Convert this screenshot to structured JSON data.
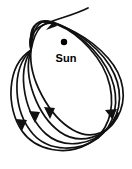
{
  "figure": {
    "kind": "orbit-precession-diagram",
    "width": 132,
    "height": 169,
    "background_color": "#ffffff",
    "stroke_color": "#111111",
    "line_width": 1.7
  },
  "sun": {
    "label": "Sun",
    "dot_color": "#000000",
    "dot_radius": 3.2,
    "center_x": 64,
    "center_y": 42,
    "label_x": 64,
    "label_y": 53
  },
  "node": {
    "name": "convergence-node",
    "description": "Common point where all orbital loops cross",
    "x": 31,
    "y": 50
  },
  "orbits": [
    {
      "id": "orbit-1",
      "label": "orbit loop 1",
      "rotation_deg": 0,
      "path": "M31,50 C6,66 6,108 22,131 C36,151 66,156 88,144 C108,133 115,110 110,86 C104,58 78,33 58,25 C44,19 35,28 31,50 Z"
    },
    {
      "id": "orbit-2",
      "label": "orbit loop 2",
      "rotation_deg": 9,
      "path": "M31,50 C10,70 14,112 33,134 C49,152 79,152 98,138 C116,124 120,100 111,77 C100,50 72,28 52,22 C39,18 32,29 31,50 Z"
    },
    {
      "id": "orbit-3",
      "label": "orbit loop 3",
      "rotation_deg": 18,
      "path": "M31,50 C16,74 25,115 46,134 C64,150 93,145 108,128 C123,111 123,87 110,66 C95,42 65,24 47,21 C35,19 30,31 31,50 Z"
    },
    {
      "id": "orbit-4",
      "label": "orbit loop 4",
      "rotation_deg": 27,
      "path": "M31,50 C22,77 38,116 60,132 C80,146 106,137 117,118 C128,99 124,76 108,58 C90,37 60,22 43,22 C32,22 29,33 31,50 Z"
    },
    {
      "id": "orbit-5",
      "label": "orbit loop 5 (outermost, with entry tail)",
      "rotation_deg": 36,
      "path": "M88,8 C72,16 55,19 43,25 C31,31 28,40 31,50 C31,50 31,50 31,50 C28,79 50,117 73,130 C92,141 112,132 118,113"
    }
  ],
  "arrows": [
    {
      "id": "arrow-top",
      "label": "inbound direction arrow (top)",
      "tip_x": 46,
      "tip_y": 30,
      "angle_deg": 213,
      "points": "46,30 57,26 54,21"
    },
    {
      "id": "arrow-left-outer",
      "label": "direction arrow (lower left, outer loop)",
      "tip_x": 22,
      "tip_y": 131,
      "angle_deg": 100,
      "points": "22,131 16,119 27,120"
    },
    {
      "id": "arrow-left-inner",
      "label": "direction arrow (lower left, inner loop)",
      "tip_x": 35,
      "tip_y": 123,
      "angle_deg": 95,
      "points": "35,123 29,111 40,112"
    },
    {
      "id": "arrow-middle",
      "label": "direction arrow (lower middle)",
      "tip_x": 50,
      "tip_y": 119,
      "angle_deg": 92,
      "points": "50,119 44,107 55,108"
    },
    {
      "id": "arrow-right",
      "label": "outbound direction arrow (right)",
      "tip_x": 117,
      "tip_y": 109,
      "angle_deg": 315,
      "points": "117,109 105,110 112,119"
    }
  ]
}
